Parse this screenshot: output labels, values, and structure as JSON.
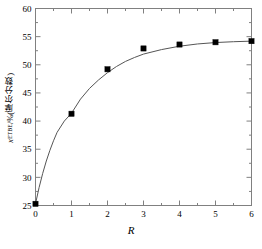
{
  "chart_data": {
    "type": "scatter",
    "title": "",
    "xlabel": "R",
    "ylabel_symbol": "x",
    "ylabel_subscript": "ETBE",
    "ylabel_units": "/%(摩尔分数)",
    "ylabel_full": "x ETBE /%(摩尔分数)",
    "xlim": [
      0,
      6
    ],
    "ylim": [
      25,
      60
    ],
    "xticks": [
      0,
      1,
      2,
      3,
      4,
      5,
      6
    ],
    "xtick_labels": [
      "0",
      "1",
      "2",
      "3",
      "4",
      "5",
      "6"
    ],
    "xminor_ticks": [
      0.5,
      1.5,
      2.5,
      3.5,
      4.5,
      5.5
    ],
    "yticks": [
      25,
      30,
      35,
      40,
      45,
      50,
      55,
      60
    ],
    "ytick_labels": [
      "25",
      "30",
      "35",
      "40",
      "45",
      "50",
      "55",
      "60"
    ],
    "yminor_ticks": [
      27.5,
      32.5,
      37.5,
      42.5,
      47.5,
      52.5,
      57.5
    ],
    "grid": false,
    "legend": "none",
    "marker": "filled-square",
    "marker_color": "#000000",
    "line_color": "#555555",
    "frame_color": "#808080",
    "series": [
      {
        "name": "ETBE mole fraction",
        "x": [
          0,
          1,
          2,
          3,
          4,
          5,
          6
        ],
        "values": [
          25.3,
          41.3,
          49.2,
          52.9,
          53.6,
          54.0,
          54.2
        ]
      }
    ],
    "fit_curve": {
      "name": "fitted trend",
      "x": [
        0,
        0.1,
        0.2,
        0.3,
        0.4,
        0.5,
        0.6,
        0.8,
        1.0,
        1.25,
        1.5,
        1.75,
        2.0,
        2.25,
        2.5,
        2.75,
        3.0,
        3.5,
        4.0,
        4.5,
        5.0,
        5.5,
        6.0
      ],
      "y": [
        25.3,
        28.2,
        30.7,
        32.9,
        34.8,
        36.5,
        38.0,
        40.0,
        41.4,
        43.9,
        45.8,
        47.3,
        48.6,
        49.7,
        50.6,
        51.3,
        51.9,
        52.7,
        53.3,
        53.7,
        53.95,
        54.1,
        54.2
      ]
    }
  },
  "axes": {
    "x_axis_name": "R axis",
    "y_axis_name": "ETBE mole fraction axis"
  }
}
